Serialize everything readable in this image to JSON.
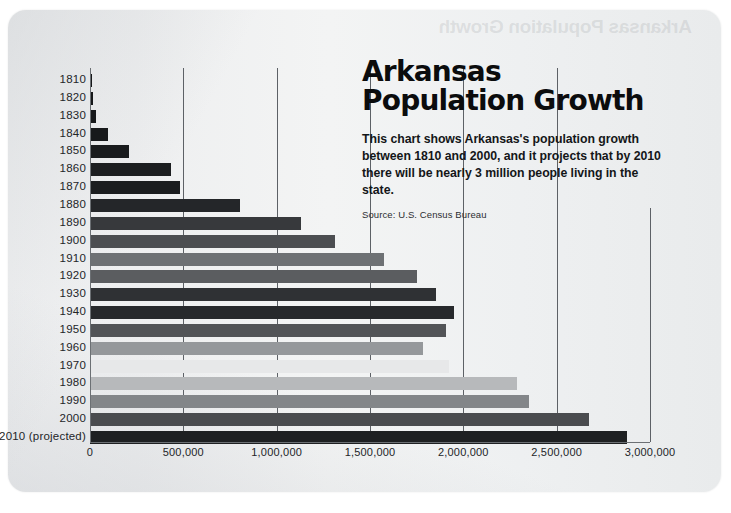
{
  "document": {
    "title_line1": "Arkansas",
    "title_line2": "Population Growth",
    "description": "This chart shows Arkansas's population growth between 1810 and 2000, and it projects that by 2010 there will be nearly 3 million people living in the state.",
    "source": "Source: U.S. Census Bureau",
    "bleed_text": "Arkansas Population Growth"
  },
  "chart_data": {
    "type": "bar",
    "orientation": "horizontal",
    "title": "Arkansas Population Growth",
    "xlabel": "",
    "ylabel": "",
    "xlim": [
      0,
      3000000
    ],
    "grid": true,
    "legend": "none",
    "xticks": [
      0,
      500000,
      1000000,
      1500000,
      2000000,
      2500000,
      3000000
    ],
    "xtick_labels": [
      "0",
      "500,000",
      "1,000,000",
      "1,500,000",
      "2,000,000",
      "2,500,000",
      "3,000,000"
    ],
    "categories": [
      "1810",
      "1820",
      "1830",
      "1840",
      "1850",
      "1860",
      "1870",
      "1880",
      "1890",
      "1900",
      "1910",
      "1920",
      "1930",
      "1940",
      "1950",
      "1960",
      "1970",
      "1980",
      "1990",
      "2000",
      "2010 (projected)"
    ],
    "values": [
      1062,
      14273,
      30388,
      97574,
      209897,
      435450,
      484471,
      802525,
      1128211,
      1311564,
      1574449,
      1752204,
      1854482,
      1949387,
      1909511,
      1786272,
      1923295,
      2286435,
      2350725,
      2673400,
      2875000
    ],
    "bar_colors": [
      "#16181a",
      "#16181a",
      "#16181a",
      "#17191b",
      "#191b1d",
      "#1c1e20",
      "#1b1d1f",
      "#242629",
      "#37393c",
      "#4c4e51",
      "#6e7174",
      "#5b5d60",
      "#2f3134",
      "#27292c",
      "#525457",
      "#95989b",
      "#e7e8e9",
      "#b7b9bb",
      "#838689",
      "#4a4c4f",
      "#1e2022"
    ]
  }
}
